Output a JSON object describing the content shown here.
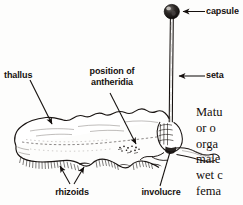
{
  "figure": {
    "background_color": "#fdfdfc",
    "ink_color": "#15100e"
  },
  "labels": [
    {
      "id": "capsule",
      "text": "capsule",
      "name": "label-capsule"
    },
    {
      "id": "seta",
      "text": "seta",
      "name": "label-seta"
    },
    {
      "id": "thallus",
      "text": "thallus",
      "name": "label-thallus"
    },
    {
      "id": "antheridia_line1",
      "text": "position of",
      "name": "label-position-of-antheridia-line1"
    },
    {
      "id": "antheridia_line2",
      "text": "antheridia",
      "name": "label-position-of-antheridia-line2"
    },
    {
      "id": "rhizoids",
      "text": "rhizoids",
      "name": "label-rhizoids"
    },
    {
      "id": "involucre",
      "text": "involucre",
      "name": "label-involucre"
    }
  ],
  "body_text": {
    "lines": [
      "Matu",
      "or o",
      "orga",
      "male",
      "wet c",
      "fema"
    ]
  }
}
